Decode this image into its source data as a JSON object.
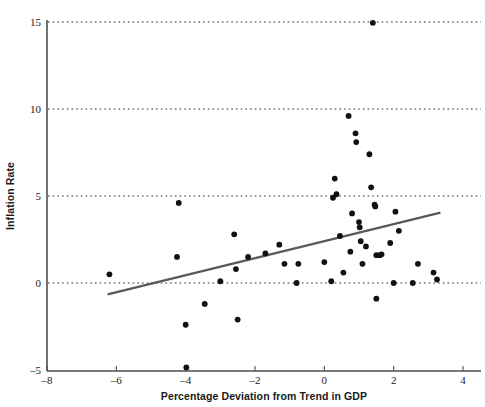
{
  "chart_data": {
    "type": "scatter",
    "title": "",
    "xlabel": "Percentage Deviation from Trend in GDP",
    "ylabel": "Inflation Rate",
    "xlim": [
      -8,
      4.4
    ],
    "ylim": [
      -5,
      15.6
    ],
    "xticks": [
      -8,
      -6,
      -4,
      -2,
      0,
      2,
      4
    ],
    "xtick_labels": [
      "–8",
      "–6",
      "–4",
      "–2",
      "0",
      "2",
      "4"
    ],
    "yticks": [
      -5,
      0,
      5,
      10,
      15
    ],
    "ytick_labels": [
      "–5",
      "0",
      "5",
      "10",
      "15"
    ],
    "grid": "horizontal-dotted",
    "gridlines_y": [
      0,
      5,
      10,
      15
    ],
    "legend": "none",
    "marker": {
      "shape": "circle",
      "color": "#111111",
      "size": 4.2
    },
    "series": [
      {
        "name": "Inflation vs GDP deviation",
        "points": [
          [
            -6.2,
            0.5
          ],
          [
            -4.2,
            4.6
          ],
          [
            -4.25,
            1.5
          ],
          [
            -4.0,
            -2.4
          ],
          [
            -3.98,
            -4.85
          ],
          [
            -3.45,
            -1.2
          ],
          [
            -3.0,
            0.1
          ],
          [
            -2.6,
            2.8
          ],
          [
            -2.55,
            0.8
          ],
          [
            -2.5,
            -2.1
          ],
          [
            -2.2,
            1.5
          ],
          [
            -1.7,
            1.7
          ],
          [
            -1.3,
            2.2
          ],
          [
            -1.15,
            1.1
          ],
          [
            -0.75,
            1.1
          ],
          [
            -0.8,
            0.0
          ],
          [
            0.0,
            1.2
          ],
          [
            0.2,
            0.1
          ],
          [
            0.25,
            4.9
          ],
          [
            0.35,
            5.1
          ],
          [
            0.3,
            6.0
          ],
          [
            0.45,
            2.7
          ],
          [
            0.55,
            0.6
          ],
          [
            0.7,
            9.6
          ],
          [
            0.75,
            1.8
          ],
          [
            0.8,
            4.0
          ],
          [
            0.9,
            8.6
          ],
          [
            0.92,
            8.1
          ],
          [
            1.0,
            3.5
          ],
          [
            1.02,
            3.2
          ],
          [
            1.05,
            2.4
          ],
          [
            1.1,
            1.1
          ],
          [
            1.2,
            2.1
          ],
          [
            1.3,
            7.4
          ],
          [
            1.35,
            5.5
          ],
          [
            1.4,
            14.95
          ],
          [
            1.45,
            4.5
          ],
          [
            1.47,
            4.4
          ],
          [
            1.5,
            1.6
          ],
          [
            1.6,
            1.6
          ],
          [
            1.65,
            1.65
          ],
          [
            1.5,
            -0.9
          ],
          [
            1.9,
            2.3
          ],
          [
            2.0,
            0.0
          ],
          [
            2.05,
            4.1
          ],
          [
            2.15,
            3.0
          ],
          [
            2.55,
            0.0
          ],
          [
            2.7,
            1.1
          ],
          [
            3.15,
            0.6
          ],
          [
            3.25,
            0.2
          ]
        ]
      }
    ],
    "trendline": {
      "label": "fitted regression line",
      "color": "#595959",
      "x_start": -6.25,
      "y_start": -0.65,
      "x_end": 3.35,
      "y_end": 4.05
    }
  },
  "axes": {
    "x_axis_name": "x-axis",
    "y_axis_name": "y-axis"
  }
}
